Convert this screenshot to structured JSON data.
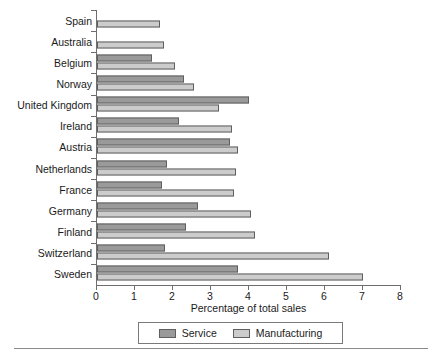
{
  "chart_data": {
    "type": "bar",
    "orientation": "horizontal",
    "title": "",
    "xlabel": "Percentage of total sales",
    "ylabel": "",
    "xlim": [
      0,
      8
    ],
    "xticks": [
      0,
      1,
      2,
      3,
      4,
      5,
      6,
      7,
      8
    ],
    "grid": false,
    "legend_position": "bottom",
    "categories": [
      "Spain",
      "Australia",
      "Belgium",
      "Norway",
      "United Kingdom",
      "Ireland",
      "Austria",
      "Netherlands",
      "France",
      "Germany",
      "Finland",
      "Switzerland",
      "Sweden"
    ],
    "series": [
      {
        "name": "Service",
        "color": "#9a9a9a",
        "values": [
          0,
          0,
          1.45,
          2.3,
          4.0,
          2.15,
          3.5,
          1.85,
          1.7,
          2.65,
          2.35,
          1.8,
          3.7
        ]
      },
      {
        "name": "Manufacturing",
        "color": "#cccccc",
        "values": [
          1.65,
          1.75,
          2.05,
          2.55,
          3.2,
          3.55,
          3.7,
          3.65,
          3.6,
          4.05,
          4.15,
          6.1,
          7.0
        ]
      }
    ]
  },
  "legend": {
    "items": [
      {
        "label": "Service",
        "swatch": "service"
      },
      {
        "label": "Manufacturing",
        "swatch": "manufacturing"
      }
    ]
  }
}
